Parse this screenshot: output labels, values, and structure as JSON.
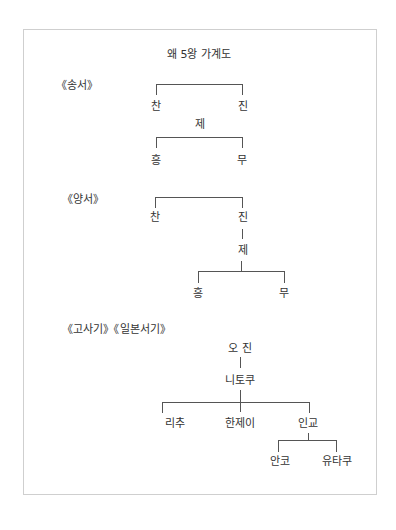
{
  "title": "왜 5왕 가계도",
  "sections": [
    {
      "source": "《송서》",
      "nodes": {
        "chan": "찬",
        "jin": "진",
        "je": "제",
        "heung": "흥",
        "mu": "무"
      }
    },
    {
      "source": "《양서》",
      "nodes": {
        "chan": "찬",
        "jin": "진",
        "je": "제",
        "heung": "흥",
        "mu": "무"
      }
    },
    {
      "source": "《고사기》《일본서기》",
      "nodes": {
        "ojin": "오 진",
        "nintoku": "니토쿠",
        "richu": "리추",
        "hanzei": "한제이",
        "ingyo": "인교",
        "anko": "안코",
        "yutaku": "유타쿠"
      }
    }
  ],
  "colors": {
    "border": "#cfcfcf",
    "line": "#555555",
    "text": "#333333"
  }
}
